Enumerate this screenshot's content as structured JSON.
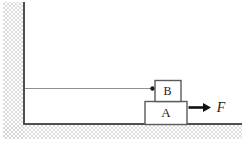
{
  "diagram": {
    "block_a_label": "A",
    "block_b_label": "B",
    "force_label": "F"
  },
  "colors": {
    "background": "#ffffff",
    "hatch": "#d4d4d4",
    "structure_line": "#4f4f4f",
    "block_outline": "#5a5a5a",
    "block_fill": "#ffffff",
    "string": "#8f8f8f",
    "arrow": "#111111",
    "dot": "#1a1a1a",
    "text": "#222222"
  }
}
